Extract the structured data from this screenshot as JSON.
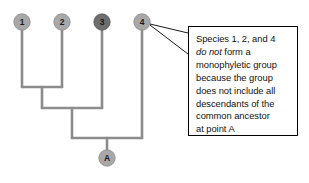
{
  "figure": {
    "type": "cladogram",
    "background_color": "#ffffff"
  },
  "tree": {
    "branch_color": "#8c8c8c",
    "branch_width": 2.6,
    "tips": [
      {
        "id": "tip-1",
        "label": "1",
        "x": 22,
        "y": 22,
        "fill": "#a8a8a8",
        "stroke": "#8a8a8a",
        "radius": 8.2,
        "branch_bottom": 87
      },
      {
        "id": "tip-2",
        "label": "2",
        "x": 62,
        "y": 22,
        "fill": "#a8a8a8",
        "stroke": "#8a8a8a",
        "radius": 8.2,
        "branch_bottom": 87
      },
      {
        "id": "tip-3",
        "label": "3",
        "x": 102,
        "y": 22,
        "fill": "#6e6e6e",
        "stroke": "#5c5c5c",
        "radius": 8.2,
        "branch_bottom": 108
      },
      {
        "id": "tip-4",
        "label": "4",
        "x": 142,
        "y": 22,
        "fill": "#a8a8a8",
        "stroke": "#8a8a8a",
        "radius": 8.2,
        "branch_bottom": 138
      }
    ],
    "internal_nodes": [
      {
        "id": "node-12",
        "joins": [
          "1",
          "2"
        ],
        "bar_y": 87,
        "bar_x1": 22,
        "bar_x2": 62,
        "stem_x": 42,
        "stem_bottom": 108
      },
      {
        "id": "node-123",
        "joins": [
          "node-12",
          "3"
        ],
        "bar_y": 108,
        "bar_x1": 42,
        "bar_x2": 102,
        "stem_x": 72,
        "stem_bottom": 138
      },
      {
        "id": "node-root-A",
        "joins": [
          "node-123",
          "4"
        ],
        "bar_y": 138,
        "bar_x1": 72,
        "bar_x2": 142,
        "stem_x": 107,
        "stem_bottom": 150
      }
    ],
    "root": {
      "id": "root-node-a",
      "label": "A",
      "x": 107,
      "y": 158,
      "fill": "#a8a8a8",
      "stroke": "#8a8a8a",
      "radius": 8.2
    }
  },
  "leader": {
    "name": "callout-pointer",
    "color": "#1a1a1a",
    "width": 1,
    "strokes": [
      {
        "x1": 150,
        "y1": 24,
        "x2": 188,
        "y2": 33
      },
      {
        "x1": 150,
        "y1": 25,
        "x2": 188,
        "y2": 54
      }
    ]
  },
  "callout": {
    "border_color": "#000000",
    "text_color": "#121212",
    "lines": [
      {
        "before": "Species 1, 2, and 4",
        "emphasis": "",
        "after": ""
      },
      {
        "before": "",
        "emphasis": "do not",
        "after": " form a"
      },
      {
        "before": "monophyletic group",
        "emphasis": "",
        "after": ""
      },
      {
        "before": "because the group",
        "emphasis": "",
        "after": ""
      },
      {
        "before": "does not include all",
        "emphasis": "",
        "after": ""
      },
      {
        "before": "descendants of the",
        "emphasis": "",
        "after": ""
      },
      {
        "before": "common ancestor",
        "emphasis": "",
        "after": ""
      },
      {
        "before": "at point A",
        "emphasis": "",
        "after": ""
      }
    ],
    "full_text": "Species 1, 2, and 4 do not form a monophyletic group because the group does not include all descendants of the common ancestor at point A"
  }
}
